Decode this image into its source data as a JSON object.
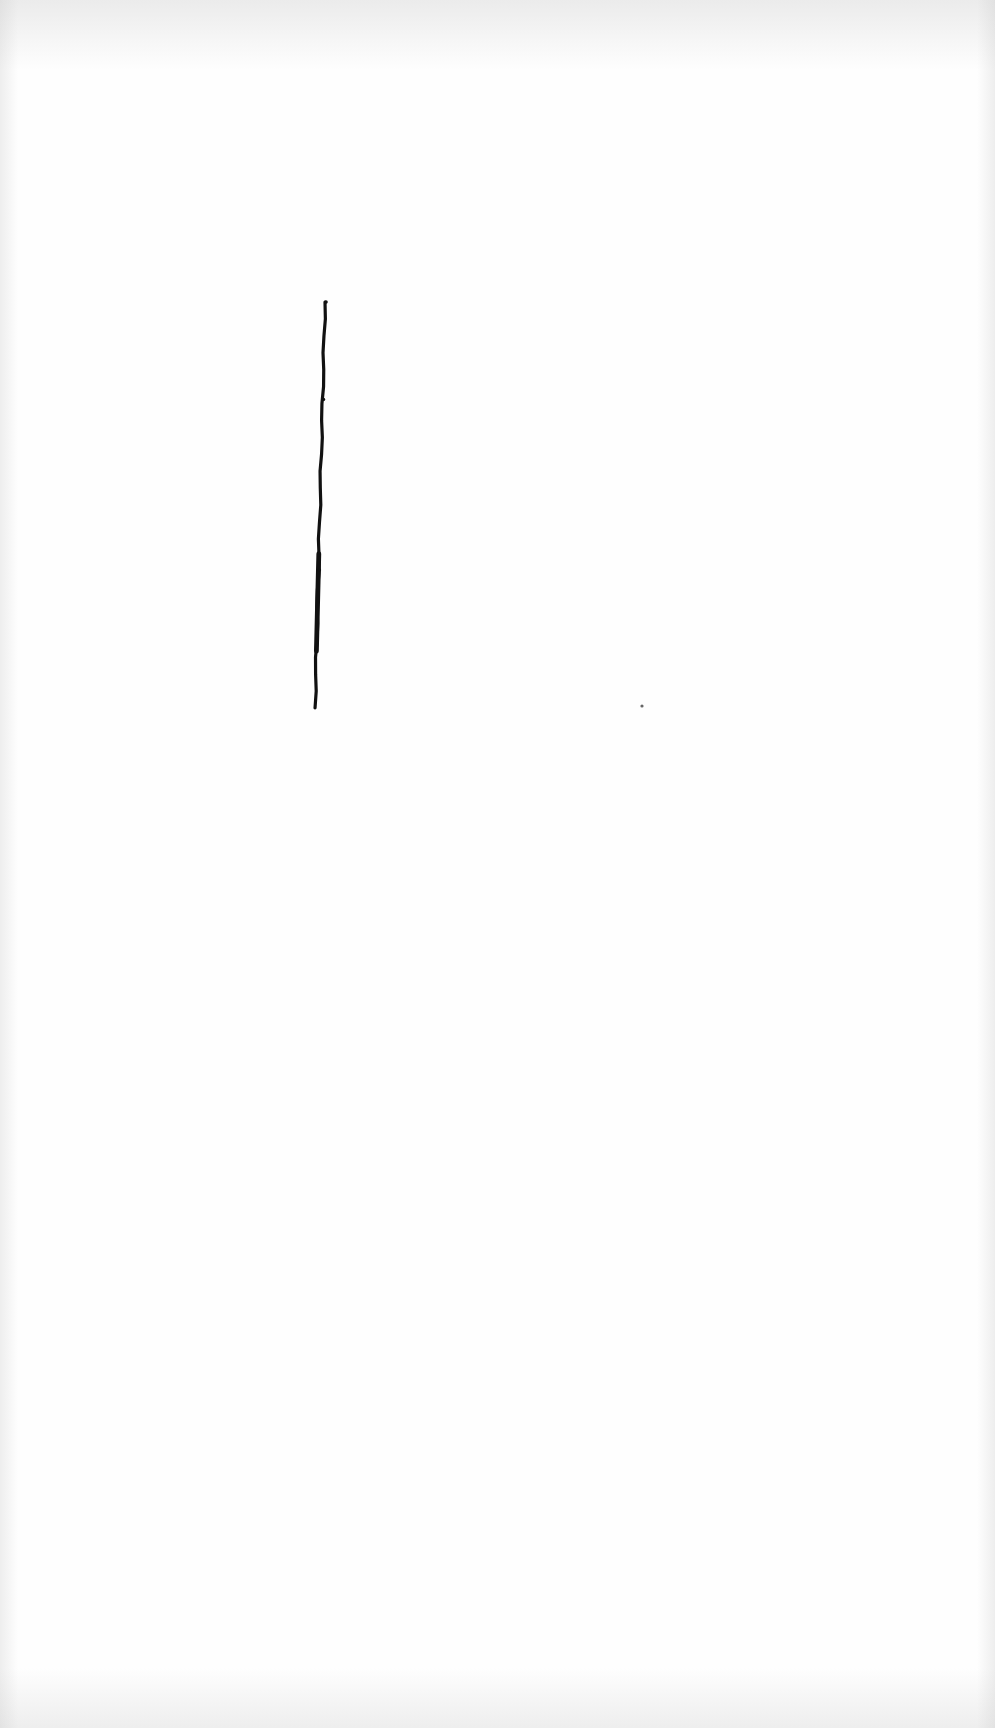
{
  "page": {
    "width": 995,
    "height": 1728,
    "background_color": "#fefefe",
    "edge_shade_color": "#c8c8c8"
  },
  "ink_line": {
    "color": "#111111",
    "x_top": 325,
    "y_top": 302,
    "x_bottom": 315,
    "y_bottom": 708,
    "stroke_width": 3.2
  },
  "speck": {
    "color": "#666666",
    "cx": 642,
    "cy": 706,
    "r": 1.6
  }
}
